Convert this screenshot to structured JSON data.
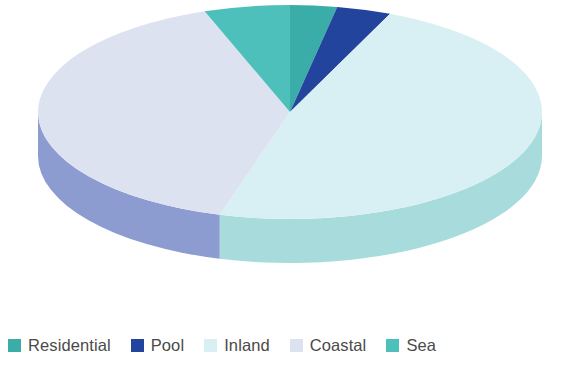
{
  "chart_data": {
    "type": "pie",
    "title": "",
    "subtitle": "",
    "xlabel": "",
    "ylabel": "",
    "three_d": true,
    "legend_position": "bottom",
    "grid": false,
    "start_angle_deg": 0,
    "direction": "clockwise",
    "categories": [
      "Residential",
      "Pool",
      "Inland",
      "Coastal",
      "Sea"
    ],
    "values": [
      3,
      3.5,
      48,
      40,
      5.5
    ],
    "units": "percent",
    "slices": [
      {
        "label": "Residential",
        "value": 3,
        "percent": 3,
        "color": "#3aada8",
        "side_color": "#7fd3d2",
        "start_angle_deg": 0,
        "end_angle_deg": 10.8
      },
      {
        "label": "Pool",
        "value": 3.5,
        "percent": 3.5,
        "color": "#23449c",
        "side_color": "#3f64b5",
        "start_angle_deg": 10.8,
        "end_angle_deg": 23.4
      },
      {
        "label": "Inland",
        "value": 48,
        "percent": 48,
        "color": "#d8f0f3",
        "side_color": "#a8dcdc",
        "start_angle_deg": 23.4,
        "end_angle_deg": 196.2
      },
      {
        "label": "Coastal",
        "value": 40,
        "percent": 40,
        "color": "#dde2f1",
        "side_color": "#8c9bd0",
        "start_angle_deg": 196.2,
        "end_angle_deg": 340.2
      },
      {
        "label": "Sea",
        "value": 5.5,
        "percent": 5.5,
        "color": "#4dc0bc",
        "side_color": "#8ad8d6",
        "start_angle_deg": 340.2,
        "end_angle_deg": 360
      }
    ]
  },
  "legend": {
    "items": [
      {
        "label": "Residential",
        "color": "#3aada8"
      },
      {
        "label": "Pool",
        "color": "#23449c"
      },
      {
        "label": "Inland",
        "color": "#d8f0f3"
      },
      {
        "label": "Coastal",
        "color": "#dde2f1"
      },
      {
        "label": "Sea",
        "color": "#4dc0bc"
      }
    ]
  },
  "canvas": {
    "background": "#ffffff",
    "text_color": "#4a4a4a"
  }
}
